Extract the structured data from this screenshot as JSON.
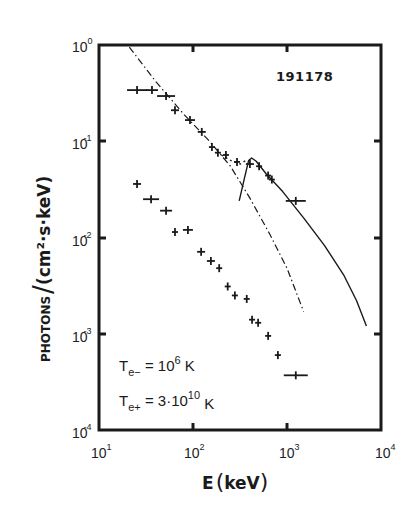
{
  "chart_data": {
    "type": "scatter",
    "title": "191178",
    "xlabel": "E (keV)",
    "ylabel": "PHOTONS / (cm²·s·keV)",
    "xscale": "log",
    "yscale": "log",
    "xlim": [
      10,
      10000
    ],
    "ylim": [
      0.0001,
      1
    ],
    "x_ticks": [
      "10^1",
      "10^2",
      "10^3",
      "10^4"
    ],
    "y_ticks": [
      "10^0",
      "10^-1",
      "10^-2",
      "10^-3",
      "10^-4"
    ],
    "grid": false,
    "legend": null,
    "annotations": [
      "Te- = 10^6 K",
      "Te+ = 3·10^10 K",
      "191178"
    ],
    "series": [
      {
        "name": "upper spectrum (data)",
        "style": "crosses",
        "x": [
          25.4,
          36.6,
          51.7,
          64.3,
          92.9,
          124,
          159,
          184,
          224,
          294,
          403,
          505,
          630,
          690,
          1240
        ],
        "y": [
          0.34,
          0.34,
          0.295,
          0.21,
          0.166,
          0.125,
          0.087,
          0.076,
          0.072,
          0.061,
          0.058,
          0.055,
          0.044,
          0.04,
          0.024
        ],
        "xerr_px": [
          10,
          6,
          9,
          4,
          5,
          4,
          3,
          3,
          3,
          3,
          4,
          3,
          3,
          3,
          10
        ]
      },
      {
        "name": "lower spectrum (data)",
        "style": "crosses",
        "x": [
          25.4,
          35.8,
          51.7,
          64.3,
          88.3,
          122,
          155,
          190,
          234,
          279,
          373,
          425,
          493,
          630,
          800,
          1240
        ],
        "y": [
          0.036,
          0.025,
          0.019,
          0.0114,
          0.012,
          0.0071,
          0.0057,
          0.0048,
          0.0031,
          0.0025,
          0.0023,
          0.0014,
          0.0013,
          0.00095,
          0.0006,
          0.00037
        ],
        "xerr_px": [
          4,
          8,
          6,
          3,
          5,
          4,
          4,
          3,
          3,
          3,
          3,
          3,
          3,
          3,
          3,
          12
        ]
      },
      {
        "name": "thermal model (dash-dot)",
        "style": "dashdot",
        "x": [
          21,
          40,
          80,
          150,
          250,
          400,
          650,
          1000,
          1500
        ],
        "y": [
          0.95,
          0.42,
          0.19,
          0.1,
          0.055,
          0.026,
          0.011,
          0.0048,
          0.0017
        ]
      },
      {
        "name": "annihilation-line model (dotted)",
        "style": "dotted",
        "x": [
          200,
          260,
          320,
          380
        ],
        "y": [
          0.072,
          0.062,
          0.058,
          0.065
        ]
      },
      {
        "name": "positron model (solid)",
        "style": "solid",
        "x": [
          310,
          350,
          390,
          420,
          470,
          600,
          900,
          1500,
          2500,
          4000,
          5500,
          7000
        ],
        "y": [
          0.024,
          0.04,
          0.063,
          0.067,
          0.062,
          0.046,
          0.03,
          0.016,
          0.0083,
          0.0041,
          0.0022,
          0.0012
        ]
      }
    ]
  },
  "chart": {
    "run_id": "191178",
    "x_axis": {
      "label_main": "E",
      "label_unit": "keV",
      "ticks": [
        {
          "base": "10",
          "exp": "1"
        },
        {
          "base": "10",
          "exp": "2"
        },
        {
          "base": "10",
          "exp": "3"
        },
        {
          "base": "10",
          "exp": "4"
        }
      ]
    },
    "y_axis": {
      "label_photons": "PHOTONS",
      "label_unit": "(cm²·s·keV)",
      "ticks": [
        {
          "base": "10",
          "exp": "0"
        },
        {
          "base": "10",
          "exp": "-1"
        },
        {
          "base": "10",
          "exp": "-2"
        },
        {
          "base": "10",
          "exp": "-3"
        },
        {
          "base": "10",
          "exp": "-4"
        }
      ]
    },
    "annotations": {
      "te_minus": {
        "T": "T",
        "sub": "e−",
        "eq": " = 10",
        "exp": "6",
        "unit": " K"
      },
      "te_plus": {
        "T": "T",
        "sub": "e+",
        "eq": " = 3·10",
        "exp": "10",
        "unit": " K"
      }
    },
    "colors": {
      "ink": "#1a1a1a",
      "background": "#ffffff"
    }
  }
}
